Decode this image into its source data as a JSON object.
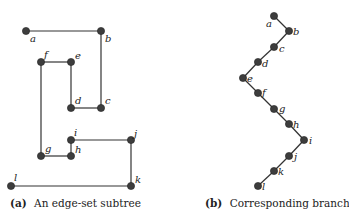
{
  "panel_a": {
    "caption_tag": "(a)",
    "caption_text": "An edge-set subtree",
    "nodes": [
      {
        "id": "a",
        "x": 26,
        "y": 31,
        "lx": 30,
        "ly": 42
      },
      {
        "id": "b",
        "x": 101,
        "y": 31,
        "lx": 105,
        "ly": 42
      },
      {
        "id": "c",
        "x": 101,
        "y": 108,
        "lx": 105,
        "ly": 104
      },
      {
        "id": "d",
        "x": 71,
        "y": 108,
        "lx": 75,
        "ly": 104
      },
      {
        "id": "e",
        "x": 71,
        "y": 62,
        "lx": 75,
        "ly": 59
      },
      {
        "id": "f",
        "x": 41,
        "y": 62,
        "lx": 44,
        "ly": 58
      },
      {
        "id": "g",
        "x": 41,
        "y": 156,
        "lx": 45,
        "ly": 152
      },
      {
        "id": "h",
        "x": 71,
        "y": 156,
        "lx": 75,
        "ly": 153
      },
      {
        "id": "i",
        "x": 71,
        "y": 140,
        "lx": 74,
        "ly": 136
      },
      {
        "id": "j",
        "x": 131,
        "y": 140,
        "lx": 134,
        "ly": 137
      },
      {
        "id": "k",
        "x": 131,
        "y": 186,
        "lx": 135,
        "ly": 183
      },
      {
        "id": "l",
        "x": 11,
        "y": 186,
        "lx": 14,
        "ly": 181
      }
    ],
    "edges": [
      [
        "a",
        "b"
      ],
      [
        "b",
        "c"
      ],
      [
        "c",
        "d"
      ],
      [
        "d",
        "e"
      ],
      [
        "e",
        "f"
      ],
      [
        "f",
        "g"
      ],
      [
        "g",
        "h"
      ],
      [
        "h",
        "i"
      ],
      [
        "i",
        "j"
      ],
      [
        "j",
        "k"
      ],
      [
        "k",
        "l"
      ]
    ]
  },
  "panel_b": {
    "caption_tag": "(b)",
    "caption_text": "Corresponding branch",
    "nodes": [
      {
        "id": "a",
        "x": 274,
        "y": 16,
        "lx": 266,
        "ly": 27
      },
      {
        "id": "b",
        "x": 289,
        "y": 31,
        "lx": 293,
        "ly": 35
      },
      {
        "id": "c",
        "x": 274,
        "y": 47,
        "lx": 279,
        "ly": 52
      },
      {
        "id": "d",
        "x": 258,
        "y": 62,
        "lx": 262,
        "ly": 67
      },
      {
        "id": "e",
        "x": 243,
        "y": 78,
        "lx": 247,
        "ly": 82
      },
      {
        "id": "f",
        "x": 258,
        "y": 93,
        "lx": 262,
        "ly": 96
      },
      {
        "id": "g",
        "x": 274,
        "y": 109,
        "lx": 279,
        "ly": 112
      },
      {
        "id": "h",
        "x": 289,
        "y": 124,
        "lx": 293,
        "ly": 128
      },
      {
        "id": "i",
        "x": 304,
        "y": 140,
        "lx": 309,
        "ly": 144
      },
      {
        "id": "j",
        "x": 289,
        "y": 156,
        "lx": 294,
        "ly": 160
      },
      {
        "id": "k",
        "x": 274,
        "y": 171,
        "lx": 278,
        "ly": 175
      },
      {
        "id": "l",
        "x": 258,
        "y": 186,
        "lx": 262,
        "ly": 190
      }
    ],
    "edges": [
      [
        "a",
        "b"
      ],
      [
        "b",
        "c"
      ],
      [
        "c",
        "d"
      ],
      [
        "d",
        "e"
      ],
      [
        "e",
        "f"
      ],
      [
        "f",
        "g"
      ],
      [
        "g",
        "h"
      ],
      [
        "h",
        "i"
      ],
      [
        "i",
        "j"
      ],
      [
        "j",
        "k"
      ],
      [
        "k",
        "l"
      ]
    ]
  }
}
